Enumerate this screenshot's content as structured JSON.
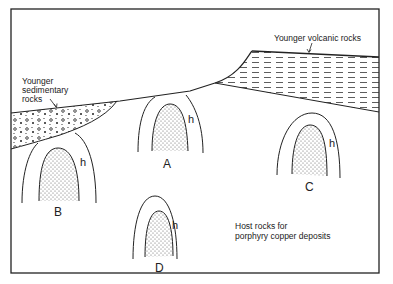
{
  "diagram": {
    "labels": {
      "younger_volcanic": "Younger volcanic rocks",
      "younger_sedimentary_1": "Younger",
      "younger_sedimentary_2": "sedimentary",
      "younger_sedimentary_3": "rocks",
      "host_rocks_1": "Host rocks for",
      "host_rocks_2": "porphyry copper deposits"
    },
    "intrusions": [
      {
        "id": "A",
        "label": "A",
        "halo_label": "h"
      },
      {
        "id": "B",
        "label": "B",
        "halo_label": "h"
      },
      {
        "id": "C",
        "label": "C",
        "halo_label": "h"
      },
      {
        "id": "D",
        "label": "D",
        "halo_label": "h"
      }
    ],
    "colors": {
      "line": "#222222",
      "background": "#ffffff"
    }
  }
}
